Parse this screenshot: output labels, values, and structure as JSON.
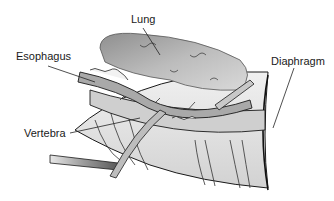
{
  "diagram": {
    "type": "anatomical-illustration",
    "style": "grayscale",
    "labels": [
      {
        "id": "lung",
        "text": "Lung",
        "x": 131,
        "y": 14
      },
      {
        "id": "esophagus",
        "text": "Esophagus",
        "x": 16,
        "y": 51
      },
      {
        "id": "diaphragm",
        "text": "Diaphragm",
        "x": 271,
        "y": 56
      },
      {
        "id": "vertebra",
        "text": "Vertebra",
        "x": 24,
        "y": 128
      }
    ],
    "colors": {
      "background": "#ffffff",
      "outline": "#1a1a1a",
      "tissue_light": "#e6e6e6",
      "tissue_mid": "#bdbdbd",
      "tissue_dark": "#8a8a8a"
    }
  }
}
